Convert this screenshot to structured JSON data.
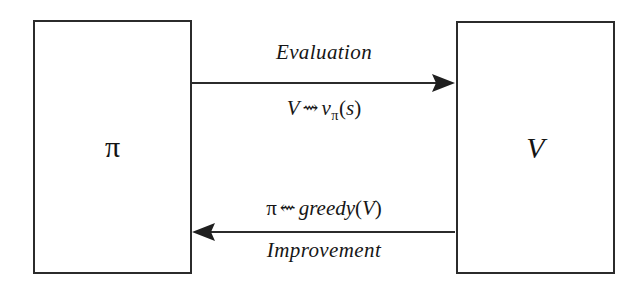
{
  "diagram": {
    "type": "cycle-diagram",
    "background_color": "#ffffff",
    "stroke_color": "#2b2b2b",
    "text_color": "#161616"
  },
  "nodes": [
    {
      "id": "policy",
      "label": "π",
      "name": "policy-box",
      "style": "upright"
    },
    {
      "id": "value",
      "label": "V",
      "name": "value-box",
      "style": "italic"
    }
  ],
  "edges": [
    {
      "id": "evaluation",
      "from": "policy",
      "to": "value",
      "direction": "right",
      "name_label": "Evaluation",
      "formula_plain": "V ⇝ vπ(s)",
      "formula_parts": {
        "lhs": "V",
        "operator": "⇝",
        "rhs_base": "v",
        "rhs_sub": "π",
        "rhs_arg_open": "(",
        "rhs_arg": "s",
        "rhs_arg_close": ")"
      }
    },
    {
      "id": "improvement",
      "from": "value",
      "to": "policy",
      "direction": "left",
      "name_label": "Improvement",
      "formula_plain": "π ⇜ greedy(V)",
      "formula_parts": {
        "lhs": "π",
        "operator": "⇜",
        "rhs_fn": "greedy",
        "rhs_arg_open": "(",
        "rhs_arg": "V",
        "rhs_arg_close": ")"
      }
    }
  ]
}
